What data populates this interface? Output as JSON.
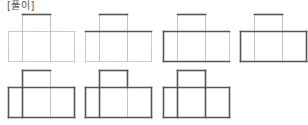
{
  "title": "[풀이]",
  "colors": {
    "solid": "#555555",
    "dotted": "#bdbdbd",
    "background": "#ffffff"
  },
  "shape": {
    "description": "T-shaped net: one square on top of the middle cell of a row of three cells",
    "grid_x": [
      0,
      14,
      42,
      66
    ],
    "grid_y": [
      0,
      17,
      47
    ]
  },
  "figures": [
    {
      "step": 1,
      "row": 1,
      "x": 8,
      "y": 14,
      "solid": [
        "top-top"
      ]
    },
    {
      "step": 2,
      "row": 1,
      "x": 85,
      "y": 14,
      "solid": [
        "top-top",
        "row-top"
      ]
    },
    {
      "step": 3,
      "row": 1,
      "x": 163,
      "y": 14,
      "solid": [
        "top-top",
        "row-top",
        "row-left",
        "row-bottom"
      ]
    },
    {
      "step": 4,
      "row": 1,
      "x": 240,
      "y": 14,
      "solid": [
        "top-top",
        "row-top",
        "row-left",
        "row-bottom",
        "row-right"
      ]
    },
    {
      "step": 5,
      "row": 2,
      "x": 8,
      "y": 70,
      "solid": [
        "top-top",
        "row-top",
        "row-left",
        "row-bottom",
        "row-right",
        "top-left",
        "inner-left"
      ]
    },
    {
      "step": 6,
      "row": 2,
      "x": 85,
      "y": 70,
      "solid": [
        "top-top",
        "row-top",
        "row-left",
        "row-bottom",
        "row-right",
        "top-left",
        "inner-left",
        "top-right"
      ]
    },
    {
      "step": 7,
      "row": 2,
      "x": 163,
      "y": 70,
      "solid": [
        "top-top",
        "row-top",
        "row-left",
        "row-bottom",
        "row-right",
        "top-left",
        "inner-left",
        "top-right",
        "inner-right"
      ]
    }
  ]
}
